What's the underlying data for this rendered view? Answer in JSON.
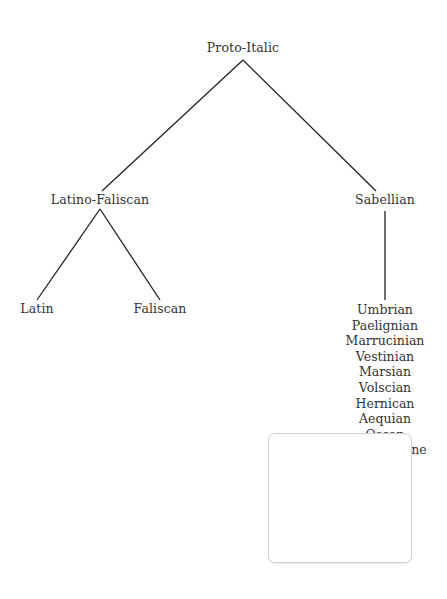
{
  "diagram": {
    "type": "language-family-tree",
    "root": {
      "label": "Proto-Italic",
      "children": [
        {
          "label": "Latino-Faliscan",
          "children": [
            {
              "label": "Latin"
            },
            {
              "label": "Faliscan"
            }
          ]
        },
        {
          "label": "Sabellian",
          "children": [
            {
              "label": "Umbrian"
            },
            {
              "label": "Paelignian"
            },
            {
              "label": "Marrucinian"
            },
            {
              "label": "Vestinian"
            },
            {
              "label": "Marsian"
            },
            {
              "label": "Volscian"
            },
            {
              "label": "Hernican"
            },
            {
              "label": "Aequian"
            },
            {
              "label": "Oscan"
            },
            {
              "label": "South Picene"
            }
          ]
        }
      ]
    },
    "colors": {
      "text": "#333333",
      "line": "#222222",
      "background": "#ffffff",
      "overlay_border": "#cfcfcf"
    }
  }
}
